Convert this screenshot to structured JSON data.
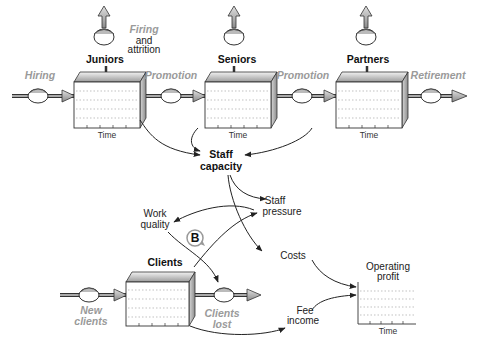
{
  "stocks": {
    "juniors": {
      "label": "Juniors",
      "axis": "Time"
    },
    "seniors": {
      "label": "Seniors",
      "axis": "Time"
    },
    "partners": {
      "label": "Partners",
      "axis": "Time"
    },
    "clients": {
      "label": "Clients"
    }
  },
  "flows": {
    "hiring": "Hiring",
    "promotion1": "Promotion",
    "promotion2": "Promotion",
    "retirement": "Retirement",
    "firing_line1": "Firing",
    "firing_line2": "and",
    "firing_line3": "attrition",
    "new_clients_line1": "New",
    "new_clients_line2": "clients",
    "clients_lost_line1": "Clients",
    "clients_lost_line2": "lost"
  },
  "variables": {
    "staff_capacity_line1": "Staff",
    "staff_capacity_line2": "capacity",
    "staff_pressure_line1": "Staff",
    "staff_pressure_line2": "pressure",
    "work_quality_line1": "Work",
    "work_quality_line2": "quality",
    "costs": "Costs",
    "fee_income_line1": "Fee",
    "fee_income_line2": "income"
  },
  "loop": {
    "label": "B"
  },
  "profit_chart": {
    "title_line1": "Operating",
    "title_line2": "profit",
    "axis": "Time"
  }
}
